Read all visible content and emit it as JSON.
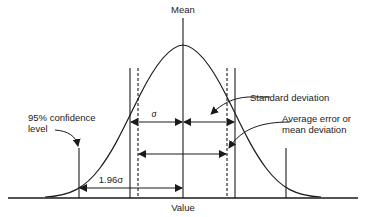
{
  "diagram": {
    "labels": {
      "mean": "Mean",
      "value": "Value",
      "sigma": "σ",
      "std_dev": "Standard deviation",
      "avg_error_line1": "Average error or",
      "avg_error_line2": "mean deviation",
      "confidence_line1": "95% confidence",
      "confidence_line2": "level",
      "one_96_sigma": "1.96σ"
    },
    "colors": {
      "stroke": "#1a1a1a",
      "text": "#222222",
      "background": "#ffffff"
    }
  }
}
